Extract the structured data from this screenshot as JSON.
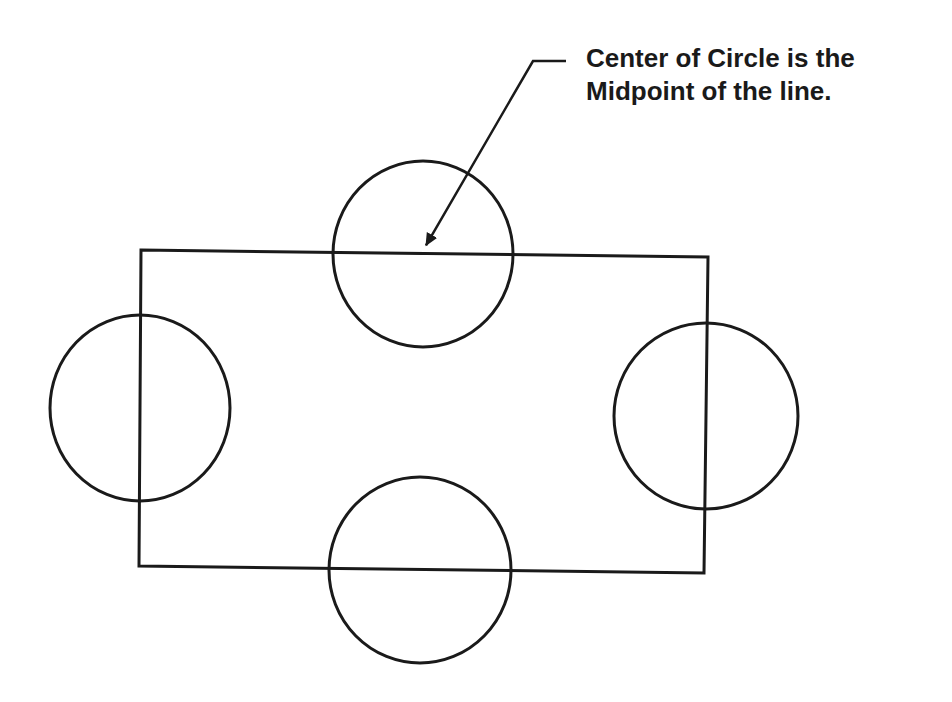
{
  "diagram": {
    "type": "geometry-construction",
    "annotation": {
      "line1": "Center of Circle is the",
      "line2": "Midpoint of the line."
    },
    "stroke_color": "#1a1a1a",
    "background_color": "#ffffff",
    "rectangle": {
      "corners": {
        "top_left": [
          141,
          250
        ],
        "top_right": [
          708,
          257
        ],
        "bottom_right": [
          704,
          573
        ],
        "bottom_left": [
          139,
          566
        ]
      }
    },
    "circles": [
      {
        "name": "top",
        "cx": 423,
        "cy": 254,
        "rx": 90,
        "ry": 93
      },
      {
        "name": "left",
        "cx": 140,
        "cy": 408,
        "rx": 90,
        "ry": 93
      },
      {
        "name": "right",
        "cx": 706,
        "cy": 416,
        "rx": 92,
        "ry": 93
      },
      {
        "name": "bottom",
        "cx": 420,
        "cy": 570,
        "rx": 91,
        "ry": 93
      }
    ],
    "leader_arrow": {
      "start": [
        566,
        61
      ],
      "elbow": [
        533,
        61
      ],
      "tip": [
        425,
        247
      ]
    }
  }
}
